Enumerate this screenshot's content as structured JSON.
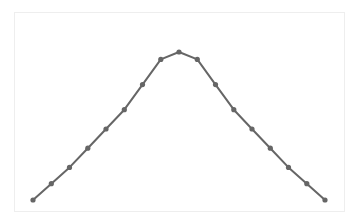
{
  "chart_data": {
    "type": "line",
    "title": "",
    "xlabel": "",
    "ylabel": "",
    "grid": false,
    "legend": null,
    "x": [
      0,
      1,
      2,
      3,
      4,
      5,
      6,
      7,
      8,
      9,
      10,
      11,
      12,
      13,
      14,
      15,
      16
    ],
    "series": [
      {
        "name": "series",
        "color": "#666666",
        "values": [
          0.0,
          0.11,
          0.22,
          0.35,
          0.48,
          0.61,
          0.78,
          0.95,
          1.0,
          0.95,
          0.78,
          0.61,
          0.48,
          0.35,
          0.22,
          0.11,
          0.0
        ]
      }
    ],
    "xlim": [
      -1,
      17
    ],
    "ylim": [
      -0.08,
      1.02
    ]
  },
  "style": {
    "frame_color": "#eeeeee",
    "line_color": "#666666",
    "background": "#ffffff"
  }
}
